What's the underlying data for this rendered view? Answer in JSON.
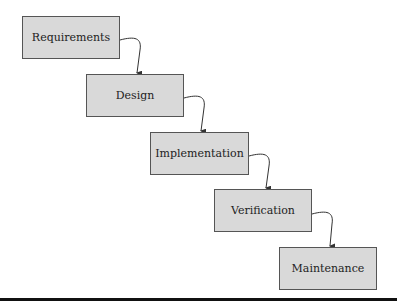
{
  "diagram": {
    "type": "waterfall-model",
    "stages": [
      {
        "label": "Requirements"
      },
      {
        "label": "Design"
      },
      {
        "label": "Implementation"
      },
      {
        "label": "Verification"
      },
      {
        "label": "Maintenance"
      }
    ],
    "edges": [
      {
        "from": "Requirements",
        "to": "Design"
      },
      {
        "from": "Design",
        "to": "Implementation"
      },
      {
        "from": "Implementation",
        "to": "Verification"
      },
      {
        "from": "Verification",
        "to": "Maintenance"
      }
    ],
    "colors": {
      "box_fill": "#d9d9d9",
      "box_border": "#555555",
      "arrow": "#333333",
      "rule": "#111111"
    }
  }
}
